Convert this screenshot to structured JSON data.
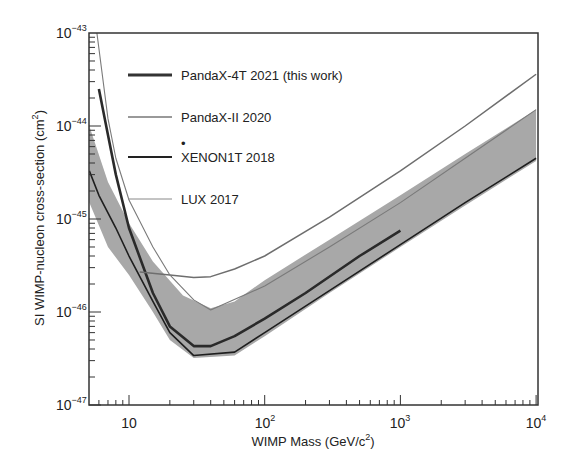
{
  "chart_data": {
    "type": "line",
    "title": "",
    "xlabel": "WIMP Mass (GeV/c²)",
    "ylabel": "SI WIMP-nucleon cross-section (cm²)",
    "xscale": "log",
    "yscale": "log",
    "xlim": [
      5.1,
      10000
    ],
    "ylim": [
      1e-47,
      1e-43
    ],
    "grid": false,
    "legend_position": "upper-left-inside",
    "x_tick_labels": [
      "10",
      "10^2",
      "10^3",
      "10^4"
    ],
    "y_tick_labels": [
      "10^-47",
      "10^-46",
      "10^-45",
      "10^-44",
      "10^-43"
    ],
    "series": [
      {
        "name": "PandaX-4T 2021 (this work)",
        "style": "thick dark line",
        "points": [
          [
            6,
            2.5e-44
          ],
          [
            7,
            8e-45
          ],
          [
            8,
            3e-45
          ],
          [
            10,
            8e-46
          ],
          [
            15,
            1.6e-46
          ],
          [
            20,
            7e-47
          ],
          [
            30,
            4.3e-47
          ],
          [
            40,
            4.3e-47
          ],
          [
            60,
            5.5e-47
          ],
          [
            100,
            8.5e-47
          ],
          [
            200,
            1.6e-46
          ],
          [
            500,
            4e-46
          ],
          [
            1000,
            7.5e-46
          ]
        ]
      },
      {
        "name": "PandaX-II 2020",
        "style": "medium gray line",
        "points": [
          [
            12,
            2.7e-46
          ],
          [
            20,
            2.5e-46
          ],
          [
            30,
            2.35e-46
          ],
          [
            40,
            2.4e-46
          ],
          [
            60,
            2.9e-46
          ],
          [
            100,
            4e-46
          ],
          [
            300,
            1.05e-45
          ],
          [
            1000,
            3.3e-45
          ],
          [
            3000,
            1e-44
          ],
          [
            10000,
            3.6e-44
          ]
        ]
      },
      {
        "name": "XENON1T 2018",
        "style": "thin dark line",
        "points": [
          [
            5.1,
            3.3e-45
          ],
          [
            6,
            1.8e-45
          ],
          [
            8,
            8e-46
          ],
          [
            10,
            4e-46
          ],
          [
            15,
            1.3e-46
          ],
          [
            20,
            6e-47
          ],
          [
            30,
            3.4e-47
          ],
          [
            60,
            3.7e-47
          ],
          [
            100,
            6e-47
          ],
          [
            300,
            1.7e-46
          ],
          [
            1000,
            5.3e-46
          ],
          [
            3000,
            1.5e-45
          ],
          [
            10000,
            4.5e-45
          ]
        ]
      },
      {
        "name": "LUX 2017",
        "style": "thin gray line",
        "points": [
          [
            5.8,
            1e-43
          ],
          [
            7,
            1.2e-44
          ],
          [
            8,
            4.5e-45
          ],
          [
            10,
            1.6e-45
          ],
          [
            15,
            5e-46
          ],
          [
            20,
            2.5e-46
          ],
          [
            30,
            1.35e-46
          ],
          [
            40,
            1.05e-46
          ],
          [
            100,
            1.9e-46
          ],
          [
            300,
            5e-46
          ],
          [
            1000,
            1.5e-45
          ],
          [
            3000,
            4.5e-45
          ],
          [
            10000,
            1.5e-44
          ]
        ]
      }
    ],
    "band": {
      "name": "PandaX-4T sensitivity band",
      "color": "#a8a8a8",
      "upper": [
        [
          5.1,
          1e-44
        ],
        [
          7,
          2.5e-45
        ],
        [
          10,
          9e-46
        ],
        [
          15,
          3.5e-46
        ],
        [
          25,
          1.5e-46
        ],
        [
          40,
          1.1e-46
        ],
        [
          60,
          1.3e-46
        ],
        [
          100,
          2.2e-46
        ],
        [
          300,
          6e-46
        ],
        [
          1000,
          1.8e-45
        ],
        [
          3000,
          5e-45
        ],
        [
          10000,
          1.5e-44
        ]
      ],
      "lower": [
        [
          5.1,
          1.5e-45
        ],
        [
          7,
          5e-46
        ],
        [
          10,
          2.5e-46
        ],
        [
          15,
          1e-46
        ],
        [
          20,
          5e-47
        ],
        [
          30,
          3.2e-47
        ],
        [
          60,
          3.4e-47
        ],
        [
          100,
          5.5e-47
        ],
        [
          300,
          1.6e-46
        ],
        [
          1000,
          5e-46
        ],
        [
          3000,
          1.4e-45
        ],
        [
          10000,
          4.2e-45
        ]
      ]
    }
  },
  "axes": {
    "x_ticks": [
      {
        "base": "10",
        "exp": ""
      },
      {
        "base": "10",
        "exp": "2"
      },
      {
        "base": "10",
        "exp": "3"
      },
      {
        "base": "10",
        "exp": "4"
      }
    ],
    "y_ticks": [
      {
        "base": "10",
        "exp": "−47"
      },
      {
        "base": "10",
        "exp": "−46"
      },
      {
        "base": "10",
        "exp": "−45"
      },
      {
        "base": "10",
        "exp": "−44"
      },
      {
        "base": "10",
        "exp": "−43"
      }
    ],
    "xlabel_main": "WIMP Mass (GeV/c",
    "xlabel_sup": "2",
    "xlabel_end": ")",
    "ylabel_main": "SI WIMP-nucleon cross-section (cm",
    "ylabel_sup": "2",
    "ylabel_end": ")"
  },
  "legend": [
    {
      "label": "PandaX-4T 2021 (this work)",
      "color": "#333333",
      "width": 3
    },
    {
      "label": "PandaX-II 2020",
      "color": "#777777",
      "width": 1.5
    },
    {
      "label": "XENON1T 2018",
      "color": "#222222",
      "width": 2
    },
    {
      "label": "LUX 2017",
      "color": "#888888",
      "width": 1
    }
  ]
}
